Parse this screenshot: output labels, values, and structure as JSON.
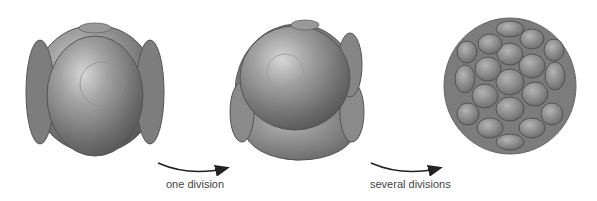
{
  "diagram": {
    "stages": [
      {
        "name": "four-cell-stage",
        "cells": 4
      },
      {
        "name": "eight-cell-stage",
        "cells": 8
      },
      {
        "name": "morula-stage",
        "cells": "many"
      }
    ],
    "arrows": [
      {
        "label": "one division"
      },
      {
        "label": "several divisions"
      }
    ],
    "colors": {
      "cell_fill": "#8a8a8a",
      "cell_edge": "#555555",
      "text": "#444444",
      "arrow": "#222222"
    }
  }
}
